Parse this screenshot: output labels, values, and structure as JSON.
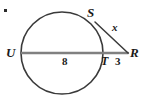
{
  "figure": {
    "type": "geometry-diagram",
    "width": 144,
    "height": 101,
    "background_color": "#ffffff",
    "colors": {
      "circle_stroke": "#3a3a3a",
      "secant_stroke": "#808080",
      "tangent_stroke": "#3a3a3a",
      "label_color": "#1a1a1a",
      "dot_color": "#2b2b2b"
    },
    "circle": {
      "center_x": 62,
      "center_y": 53,
      "radius": 41,
      "stroke_width": 1.6
    },
    "points": {
      "U": {
        "x": 22,
        "y": 53,
        "label": "U"
      },
      "T": {
        "x": 103,
        "y": 53,
        "label": "T"
      },
      "R": {
        "x": 128,
        "y": 53,
        "label": "R"
      },
      "S": {
        "x": 95,
        "y": 22,
        "label": "S"
      }
    },
    "segments": [
      {
        "name": "secant-UR",
        "from": "U",
        "to": "R",
        "x1": 22,
        "y1": 53,
        "x2": 128,
        "y2": 53,
        "stroke": "#808080",
        "stroke_width": 2.4
      },
      {
        "name": "tangent-SR",
        "from": "S",
        "to": "R",
        "x1": 95,
        "y1": 22,
        "x2": 128,
        "y2": 53,
        "stroke": "#3a3a3a",
        "stroke_width": 1.5
      }
    ],
    "labels": {
      "vertex_U": "U",
      "vertex_S": "S",
      "vertex_T": "T",
      "vertex_R": "R",
      "measure_UT": "8",
      "measure_TR": "3",
      "measure_SR": "x"
    },
    "corner_mark": {
      "name": "bullet-dot",
      "x": 4,
      "y": 9,
      "size": 3
    }
  }
}
